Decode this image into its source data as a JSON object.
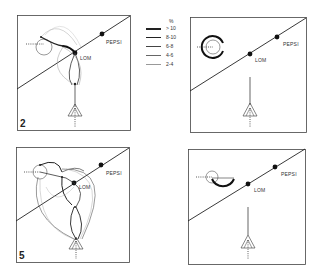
{
  "legend": {
    "unit": "%",
    "items": [
      {
        "label": "> 10",
        "weight": 2.2
      },
      {
        "label": "8-10",
        "weight": 1.3
      },
      {
        "label": "6-8",
        "weight": 0.9
      },
      {
        "label": "4-6",
        "weight": 0.6
      },
      {
        "label": "2-4",
        "weight": 0.35
      }
    ]
  },
  "panels": [
    {
      "id": "top-left",
      "number": "2",
      "label_pepsi": "PEPSI",
      "label_lom": "LOM"
    },
    {
      "id": "top-right",
      "number": "",
      "label_pepsi": "PEPSI",
      "label_lom": "LOM"
    },
    {
      "id": "bottom-left",
      "number": "5",
      "label_pepsi": "PEPSI",
      "label_lom": "LOM"
    },
    {
      "id": "bottom-right",
      "number": "",
      "label_pepsi": "PEPSI",
      "label_lom": "LOM"
    }
  ]
}
